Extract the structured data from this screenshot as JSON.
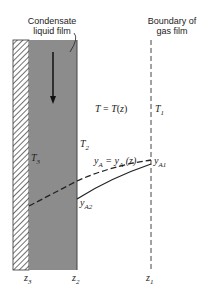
{
  "labels": {
    "film": "Condensate liquid film",
    "film_line1": "Condensate",
    "film_line2": "liquid film",
    "boundary_line1": "Boundary of",
    "boundary_line2": "gas film"
  },
  "curves": {
    "temperature_eq_lhs": "T = T(z)",
    "mole_fraction_eq": "y",
    "T1": "T",
    "T1_sub": "1",
    "T2": "T",
    "T2_sub": "2",
    "T3": "T",
    "T3_sub": "3",
    "yA1": "y",
    "yA1_sub": "A1",
    "yA2": "y",
    "yA2_sub": "A2"
  },
  "axis": {
    "z3": "z",
    "z3_sub": "3",
    "z2": "z",
    "z2_sub": "2",
    "z1": "z",
    "z1_sub": "1"
  },
  "colors": {
    "film": "#8c8c8c",
    "wall_hatch": "#333333",
    "line": "#222222"
  }
}
